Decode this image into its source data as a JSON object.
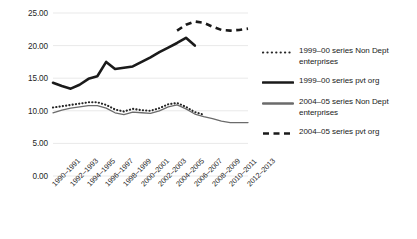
{
  "chart_data": {
    "type": "line",
    "title": "",
    "xlabel": "",
    "ylabel": "",
    "ylim": [
      0,
      25
    ],
    "ytick_step": 5,
    "ytick_labels": [
      "25.00",
      "20.00",
      "15.00",
      "10.00",
      "5.00",
      "0.00"
    ],
    "ytick_values": [
      25,
      20,
      15,
      10,
      5,
      0
    ],
    "grid": true,
    "legend_position": "right",
    "categories": [
      "1990–1991",
      "1991–1992",
      "1992–1993",
      "1993–1994",
      "1994–1995",
      "1995–1996",
      "1996–1997",
      "1997–1998",
      "1998–1999",
      "1999–2000",
      "2000–2001",
      "2001–2002",
      "2002–2003",
      "2003–2004",
      "2004–2005",
      "2005–2006",
      "2006–2007",
      "2007–2008",
      "2008–2009",
      "2009–2010",
      "2010–2011",
      "2011–2012",
      "2012–2013"
    ],
    "xtick_labels": [
      "1990–1991",
      "1992–1993",
      "1994–1995",
      "1996–1997",
      "1998–1999",
      "2000–2001",
      "2002–2003",
      "2004–2005",
      "2006–2007",
      "2008–2009",
      "2010–2011",
      "2012–2013"
    ],
    "series": [
      {
        "name": "1999–00 series Non Dept enterprises",
        "style": "dotted",
        "color": "#262626",
        "x": [
          "1990–1991",
          "1991–1992",
          "1992–1993",
          "1993–1994",
          "1994–1995",
          "1995–1996",
          "1996–1997",
          "1997–1998",
          "1998–1999",
          "1999–2000",
          "2000–2001",
          "2001–2002",
          "2002–2003",
          "2003–2004",
          "2004–2005",
          "2005–2006",
          "2006–2007",
          "2007–2008"
        ],
        "values": [
          10.5,
          10.7,
          10.9,
          11.1,
          11.3,
          11.3,
          10.9,
          10.2,
          9.9,
          10.3,
          10.1,
          10.0,
          10.4,
          11.0,
          11.2,
          10.6,
          9.8,
          9.4
        ]
      },
      {
        "name": "1999–00 series pvt org",
        "style": "solid-thick",
        "color": "#1a1a1a",
        "x": [
          "1990–1991",
          "1991–1992",
          "1992–1993",
          "1993–1994",
          "1994–1995",
          "1995–1996",
          "1996–1997",
          "1997–1998",
          "1998–1999",
          "1999–2000",
          "2000–2001",
          "2001–2002",
          "2002–2003",
          "2003–2004",
          "2004–2005",
          "2005–2006",
          "2006–2007"
        ],
        "values": [
          14.3,
          13.8,
          13.4,
          14.0,
          14.9,
          15.3,
          17.5,
          16.4,
          16.6,
          16.8,
          17.5,
          18.2,
          19.0,
          19.7,
          20.4,
          21.2,
          20.0
        ]
      },
      {
        "name": "2004–05 series Non Dept enterprises",
        "style": "solid-gray",
        "color": "#6b6b6b",
        "x": [
          "1990–1991",
          "1991–1992",
          "1992–1993",
          "1993–1994",
          "1994–1995",
          "1995–1996",
          "1996–1997",
          "1997–1998",
          "1998–1999",
          "1999–2000",
          "2000–2001",
          "2001–2002",
          "2002–2003",
          "2003–2004",
          "2004–2005",
          "2005–2006",
          "2006–2007",
          "2007–2008",
          "2008–2009",
          "2009–2010",
          "2010–2011",
          "2011–2012",
          "2012–2013"
        ],
        "values": [
          9.7,
          10.1,
          10.4,
          10.6,
          10.8,
          10.8,
          10.4,
          9.7,
          9.4,
          9.8,
          9.7,
          9.6,
          10.0,
          10.6,
          10.9,
          10.3,
          9.5,
          9.1,
          8.8,
          8.4,
          8.2,
          8.2,
          8.2
        ]
      },
      {
        "name": "2004–05 series pvt org",
        "style": "dashed",
        "color": "#1a1a1a",
        "x": [
          "2004–2005",
          "2005–2006",
          "2006–2007",
          "2007–2008",
          "2008–2009",
          "2009–2010",
          "2010–2011",
          "2011–2012",
          "2012–2013"
        ],
        "values": [
          22.3,
          23.2,
          23.7,
          23.5,
          22.9,
          22.4,
          22.3,
          22.4,
          22.6
        ]
      }
    ],
    "legend": [
      {
        "label": "1999–00 series Non Dept enterprises",
        "style": "dotted",
        "color": "#262626"
      },
      {
        "label": "1999–00 series pvt org",
        "style": "solid-thick",
        "color": "#1a1a1a"
      },
      {
        "label": "2004–05 series Non Dept enterprises",
        "style": "solid-gray",
        "color": "#6b6b6b"
      },
      {
        "label": "2004–05 series pvt org",
        "style": "dashed",
        "color": "#1a1a1a"
      }
    ]
  }
}
